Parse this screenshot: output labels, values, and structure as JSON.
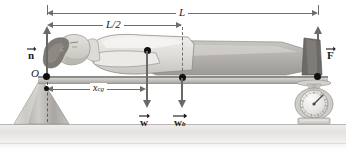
{
  "figure": {
    "type": "free-body / torque diagram"
  },
  "dimensions": {
    "total_length": {
      "label": "L",
      "name": "board-full-length"
    },
    "half_length": {
      "label": "L/2",
      "name": "board-half-length"
    },
    "center_of_gravity": {
      "symbol": "x",
      "subscript": "cg",
      "name": "center-of-gravity-distance"
    }
  },
  "forces": [
    {
      "id": "normal",
      "symbol": "n",
      "subscript": "",
      "direction": "up",
      "name": "normal-force-at-fulcrum"
    },
    {
      "id": "scale",
      "symbol": "F",
      "subscript": "",
      "direction": "up",
      "name": "scale-force"
    },
    {
      "id": "person_weight",
      "symbol": "w",
      "subscript": "",
      "direction": "down",
      "name": "person-weight"
    },
    {
      "id": "board_weight",
      "symbol": "w",
      "subscript": "b",
      "direction": "down",
      "name": "board-weight"
    }
  ],
  "points": {
    "pivot": {
      "label": "O",
      "name": "pivot-point-O"
    }
  },
  "objects": {
    "fulcrum": {
      "name": "triangular-fulcrum"
    },
    "board": {
      "name": "horizontal-board"
    },
    "person": {
      "name": "reclining-person"
    },
    "scale": {
      "name": "dial-scale"
    },
    "ground": {
      "name": "ground-surface"
    }
  },
  "colors": {
    "line": "#6f6d6a",
    "dot": "#101010",
    "board": "#bfbdb9",
    "skin": "#cfccc6",
    "hair": "#8d8a85",
    "ground": "#e9e8e6"
  }
}
